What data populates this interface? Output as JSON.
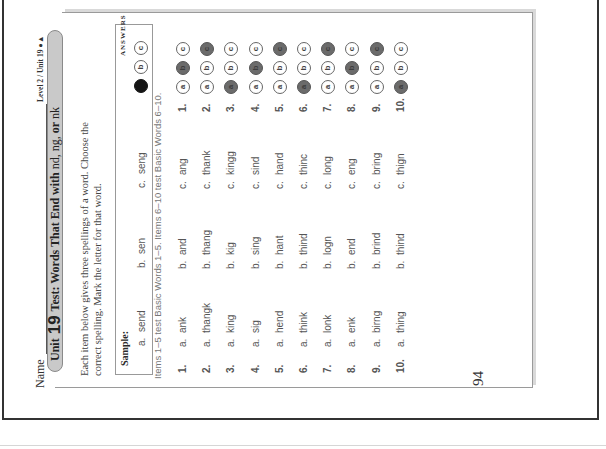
{
  "header": {
    "name_label": "Name",
    "level_label": "Level 2 / Unit 19 ●▲"
  },
  "title": {
    "unit_word": "Unit",
    "unit_number": "19",
    "main": "Test: Words That End with",
    "endings_1": "nd, ng,",
    "or_word": "or",
    "endings_2": "nk"
  },
  "instructions": "Each item below gives three spellings of a word. Choose the correct spelling. Mark the letter for that word.",
  "sample": {
    "label": "Sample:",
    "options": [
      {
        "letter": "a.",
        "word": "send"
      },
      {
        "letter": "b.",
        "word": "sen"
      },
      {
        "letter": "c.",
        "word": "seng"
      }
    ],
    "answers_header": "ANSWERS",
    "bubbles": [
      "",
      "b",
      "c"
    ],
    "selected": "a"
  },
  "items_note": "Items 1–5 test Basic Words 1–5. Items 6–10 test Basic Words 6–10.",
  "items": [
    {
      "num": "1.",
      "a": "ank",
      "b": "and",
      "c": "ang",
      "selected": "b"
    },
    {
      "num": "2.",
      "a": "thangk",
      "b": "thang",
      "c": "thank",
      "selected": "c"
    },
    {
      "num": "3.",
      "a": "king",
      "b": "kig",
      "c": "kingg",
      "selected": "a"
    },
    {
      "num": "4.",
      "a": "sig",
      "b": "sing",
      "c": "sind",
      "selected": "b"
    },
    {
      "num": "5.",
      "a": "hend",
      "b": "hant",
      "c": "hand",
      "selected": "c"
    },
    {
      "num": "6.",
      "a": "think",
      "b": "thind",
      "c": "thinc",
      "selected": "a"
    },
    {
      "num": "7.",
      "a": "lonk",
      "b": "logn",
      "c": "long",
      "selected": "c"
    },
    {
      "num": "8.",
      "a": "enk",
      "b": "end",
      "c": "eng",
      "selected": "b"
    },
    {
      "num": "9.",
      "a": "birng",
      "b": "brind",
      "c": "bring",
      "selected": "c"
    },
    {
      "num": "10.",
      "a": "thing",
      "b": "thind",
      "c": "thign",
      "selected": "a"
    }
  ],
  "labels": {
    "a": "a.",
    "b": "b.",
    "c": "c."
  },
  "bubble_letters": {
    "a": "a",
    "b": "b",
    "c": "c"
  },
  "page_number": "94"
}
